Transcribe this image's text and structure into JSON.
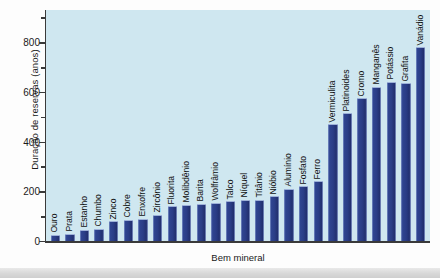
{
  "chart_data": {
    "type": "bar",
    "title": "",
    "xlabel": "Bem mineral",
    "ylabel": "Duração de reservas (anos)",
    "ylim": [
      0,
      930
    ],
    "yticks": [
      0,
      200,
      400,
      600,
      800
    ],
    "ytick_labels": [
      "0",
      "200",
      "400",
      "600",
      "800"
    ],
    "minor_ticks": [
      100,
      300,
      500,
      700,
      900
    ],
    "grid": false,
    "legend": null,
    "bar_color": "#2a3d86",
    "plot_background": "#cfe7f0",
    "categories": [
      "Ouro",
      "Prata",
      "Estanho",
      "Chumbo",
      "Zinco",
      "Cobre",
      "Enxofre",
      "Zircônio",
      "Fluorita",
      "Molibdênio",
      "Barita",
      "Wolfrâmio",
      "Talco",
      "Níquel",
      "Titânio",
      "Nióbio",
      "Alumínio",
      "Fosfato",
      "Ferro",
      "Vermiculita",
      "Platinoides",
      "Cromo",
      "Manganês",
      "Potássio",
      "Grafita",
      "Vanádio"
    ],
    "values": [
      25,
      30,
      45,
      50,
      80,
      85,
      90,
      105,
      140,
      145,
      150,
      155,
      160,
      165,
      165,
      180,
      210,
      220,
      240,
      470,
      515,
      575,
      620,
      640,
      635,
      780
    ]
  }
}
